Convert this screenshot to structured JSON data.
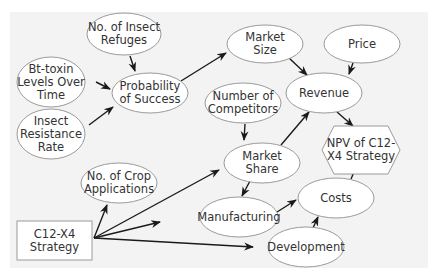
{
  "diagram": {
    "title": "",
    "colors": {
      "background": "#ffffff",
      "panel": "#f3f3f3",
      "node_fill": "#ffffff",
      "node_stroke": "#9a9a9a",
      "edge": "#1a1a1a",
      "text": "#333333"
    },
    "nodes": [
      {
        "id": "refuges",
        "shape": "ellipse",
        "label": "No. of Insect\nRefuges",
        "cx": 124,
        "cy": 34,
        "rx": 37,
        "ry": 21
      },
      {
        "id": "btoxin",
        "shape": "ellipse",
        "label": "Bt-toxin\nLevels Over\nTime",
        "cx": 51,
        "cy": 82,
        "rx": 34,
        "ry": 25
      },
      {
        "id": "probability",
        "shape": "ellipse",
        "label": "Probability\nof Success",
        "cx": 150,
        "cy": 93,
        "rx": 38,
        "ry": 20
      },
      {
        "id": "resistance",
        "shape": "ellipse",
        "label": "Insect\nResistance\nRate",
        "cx": 51,
        "cy": 134,
        "rx": 34,
        "ry": 25
      },
      {
        "id": "market_size",
        "shape": "ellipse",
        "label": "Market\nSize",
        "cx": 265,
        "cy": 44,
        "rx": 38,
        "ry": 19
      },
      {
        "id": "price",
        "shape": "ellipse",
        "label": "Price",
        "cx": 362,
        "cy": 44,
        "rx": 38,
        "ry": 19
      },
      {
        "id": "competitors",
        "shape": "ellipse",
        "label": "Number of\nCompetitors",
        "cx": 243,
        "cy": 103,
        "rx": 38,
        "ry": 20
      },
      {
        "id": "revenue",
        "shape": "ellipse",
        "label": "Revenue",
        "cx": 324,
        "cy": 93,
        "rx": 38,
        "ry": 20
      },
      {
        "id": "market_share",
        "shape": "ellipse",
        "label": "Market\nShare",
        "cx": 262,
        "cy": 163,
        "rx": 38,
        "ry": 20
      },
      {
        "id": "npv",
        "shape": "hexagon",
        "label": "NPV of C12-\nX4 Strategy",
        "cx": 361,
        "cy": 150,
        "w": 78,
        "h": 48
      },
      {
        "id": "crop_apps",
        "shape": "ellipse",
        "label": "No. of Crop\nApplications",
        "cx": 119,
        "cy": 183,
        "rx": 38,
        "ry": 20
      },
      {
        "id": "manufacturing",
        "shape": "ellipse",
        "label": "Manufacturing",
        "cx": 239,
        "cy": 217,
        "rx": 39,
        "ry": 20
      },
      {
        "id": "costs",
        "shape": "ellipse",
        "label": "Costs",
        "cx": 336,
        "cy": 198,
        "rx": 38,
        "ry": 20
      },
      {
        "id": "strategy",
        "shape": "rect",
        "label": "C12-X4\nStrategy",
        "x": 17,
        "y": 221,
        "w": 75,
        "h": 39
      },
      {
        "id": "development",
        "shape": "ellipse",
        "label": "Development",
        "cx": 306,
        "cy": 247,
        "rx": 38,
        "ry": 20
      }
    ],
    "edges": [
      {
        "from": "refuges",
        "to": "probability",
        "x1": 130,
        "y1": 56,
        "x2": 135,
        "y2": 71
      },
      {
        "from": "btoxin",
        "to": "probability",
        "x1": 96,
        "y1": 82,
        "x2": 110,
        "y2": 89
      },
      {
        "from": "resistance",
        "to": "probability",
        "x1": 89,
        "y1": 125,
        "x2": 113,
        "y2": 107
      },
      {
        "from": "probability",
        "to": "market_size",
        "x1": 181,
        "y1": 81,
        "x2": 226,
        "y2": 53
      },
      {
        "from": "market_size",
        "to": "revenue",
        "x1": 288,
        "y1": 57,
        "x2": 307,
        "y2": 75
      },
      {
        "from": "price",
        "to": "revenue",
        "x1": 353,
        "y1": 63,
        "x2": 349,
        "y2": 74
      },
      {
        "from": "competitors",
        "to": "market_share",
        "x1": 245,
        "y1": 124,
        "x2": 244,
        "y2": 140
      },
      {
        "from": "market_share",
        "to": "revenue",
        "x1": 281,
        "y1": 145,
        "x2": 309,
        "y2": 112
      },
      {
        "from": "revenue",
        "to": "npv",
        "x1": 337,
        "y1": 112,
        "x2": 353,
        "y2": 126
      },
      {
        "from": "market_share",
        "to": "manufacturing",
        "x1": 250,
        "y1": 181,
        "x2": 242,
        "y2": 196
      },
      {
        "from": "manufacturing",
        "to": "costs",
        "x1": 277,
        "y1": 212,
        "x2": 296,
        "y2": 200
      },
      {
        "from": "development",
        "to": "costs",
        "x1": 313,
        "y1": 228,
        "x2": 318,
        "y2": 217
      },
      {
        "from": "costs",
        "to": "npv",
        "x1": 351,
        "y1": 179,
        "x2": 357,
        "y2": 165
      },
      {
        "from": "strategy",
        "to": "crop_apps",
        "x1": 94,
        "y1": 238,
        "x2": 107,
        "y2": 205
      },
      {
        "from": "strategy",
        "to": "market_share",
        "x1": 94,
        "y1": 238,
        "x2": 219,
        "y2": 170
      },
      {
        "from": "strategy",
        "to": "manufacturing",
        "x1": 94,
        "y1": 238,
        "x2": 160,
        "y2": 222
      },
      {
        "from": "strategy",
        "to": "development",
        "x1": 94,
        "y1": 238,
        "x2": 253,
        "y2": 247
      }
    ]
  }
}
